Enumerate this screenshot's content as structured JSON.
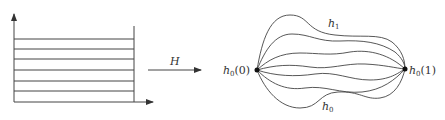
{
  "left_panel": {
    "description": "rectangle of parallel horizontal lines with axes",
    "horizontal_line_count": 6
  },
  "map_arrow": {
    "label": "H"
  },
  "right_panel": {
    "description": "homotopy family of curves between two endpoints",
    "start_label_base": "h",
    "start_label_sub": "0",
    "start_label_arg": "(0)",
    "end_label_base": "h",
    "end_label_sub": "0",
    "end_label_arg": "(1)",
    "top_curve_label_base": "h",
    "top_curve_label_sub": "1",
    "bottom_curve_label_base": "h",
    "bottom_curve_label_sub": "0",
    "curve_count": 7
  },
  "colors": {
    "stroke": "#333333",
    "background": "#ffffff"
  }
}
